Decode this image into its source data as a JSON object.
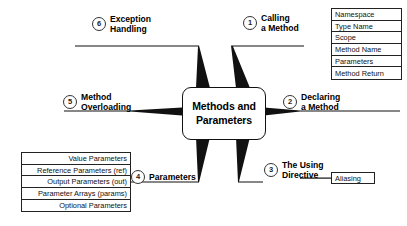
{
  "diagram": {
    "type": "mind-map",
    "center": {
      "line1": "Methods and",
      "line2": "Parameters",
      "text": "Methods and Parameters"
    },
    "branches": [
      {
        "number": "1",
        "line1": "Calling",
        "line2": "a Method",
        "label": "Calling a Method",
        "position": "top-right",
        "children": [
          "Namespace",
          "Type Name",
          "Scope",
          "Method Name",
          "Parameters",
          "Method Return"
        ]
      },
      {
        "number": "2",
        "line1": "Declaring",
        "line2": "a Method",
        "label": "Declaring a Method",
        "position": "right",
        "children": []
      },
      {
        "number": "3",
        "line1": "The Using",
        "line2": "Directive",
        "label": "The Using Directive",
        "position": "bottom-right",
        "children": [
          "Aliasing"
        ]
      },
      {
        "number": "4",
        "line1": "Parameters",
        "line2": "",
        "label": "Parameters",
        "position": "bottom-left",
        "children": [
          "Value Parameters",
          "Reference Parameters (ref)",
          "Output Parameters (out)",
          "Parameter Arrays (params)",
          "Optional Parameters"
        ]
      },
      {
        "number": "5",
        "line1": "Method",
        "line2": "Overloading",
        "label": "Method Overloading",
        "position": "left",
        "children": []
      },
      {
        "number": "6",
        "line1": "Exception",
        "line2": "Handling",
        "label": "Exception Handling",
        "position": "top-left",
        "children": []
      }
    ],
    "colors": {
      "stroke": "#111111",
      "background": "#ffffff",
      "text": "#000000"
    }
  }
}
